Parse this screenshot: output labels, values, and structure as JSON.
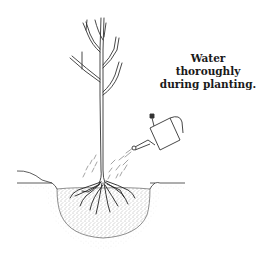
{
  "caption": {
    "line1": "Water thoroughly",
    "line2": "during planting."
  },
  "illustration": {
    "subject": "tree-being-watered",
    "elements": [
      "bare-root-tree",
      "watering-can",
      "water-spray",
      "planting-hole",
      "soil",
      "roots"
    ],
    "line_color": "#333333",
    "soil_color": "#888888"
  }
}
